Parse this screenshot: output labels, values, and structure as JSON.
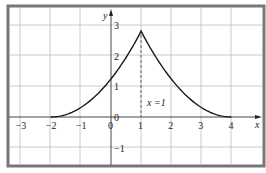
{
  "chart_data": {
    "type": "line",
    "title": "",
    "xlabel": "x",
    "ylabel": "y",
    "xlim": [
      -3.3,
      5.1
    ],
    "ylim": [
      -1.6,
      3.6
    ],
    "grid": true,
    "x_ticks": [
      "-3",
      "-2",
      "-1",
      "0",
      "1",
      "2",
      "3",
      "4"
    ],
    "y_ticks": [
      "-1",
      "0",
      "1",
      "2",
      "3"
    ],
    "annotation": "x =1",
    "series": [
      {
        "name": "f(x)",
        "x": [
          -2,
          -1.5,
          -1,
          -0.5,
          0,
          0.5,
          1,
          1.5,
          2,
          2.5,
          3,
          3.5,
          4
        ],
        "values": [
          0,
          0.08,
          0.3,
          0.68,
          1.2,
          1.88,
          2.8,
          1.88,
          1.2,
          0.68,
          0.3,
          0.08,
          0
        ]
      }
    ],
    "asymptote": {
      "type": "vertical-dashed",
      "x": 1
    },
    "colors": {
      "curve": "#1a1a1a",
      "grid": "#bdbdbd",
      "frame": "#777777"
    }
  }
}
